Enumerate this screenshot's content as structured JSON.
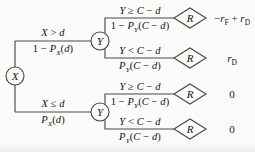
{
  "diagram": {
    "kind": "probability-event-tree",
    "colors": {
      "line": "#4a4a4a",
      "text": "#141414",
      "background": "#fbfbfa"
    },
    "root": {
      "label": "X"
    },
    "branches": [
      {
        "condition": [
          {
            "t": "X",
            "i": true
          },
          {
            "t": " > ",
            "i": false
          },
          {
            "t": "d",
            "i": true
          }
        ],
        "probability": [
          {
            "t": "1 − ",
            "i": false
          },
          {
            "t": "P",
            "i": true
          },
          {
            "t": "X",
            "i": true,
            "s": true
          },
          {
            "t": "(",
            "i": false
          },
          {
            "t": "d",
            "i": true
          },
          {
            "t": ")",
            "i": false
          }
        ],
        "node": {
          "label": "Y"
        },
        "children": [
          {
            "condition": [
              {
                "t": "Y",
                "i": true
              },
              {
                "t": " ≥ ",
                "i": false
              },
              {
                "t": "C",
                "i": true
              },
              {
                "t": " − ",
                "i": false
              },
              {
                "t": "d",
                "i": true
              }
            ],
            "probability": [
              {
                "t": "1 − ",
                "i": false
              },
              {
                "t": "P",
                "i": true
              },
              {
                "t": "Y",
                "i": true,
                "s": true
              },
              {
                "t": "(",
                "i": false
              },
              {
                "t": "C",
                "i": true
              },
              {
                "t": " − ",
                "i": false
              },
              {
                "t": "d",
                "i": true
              },
              {
                "t": ")",
                "i": false
              }
            ],
            "result_node": {
              "label": "R"
            },
            "outcome": [
              {
                "t": "−",
                "i": false
              },
              {
                "t": "r",
                "i": true
              },
              {
                "t": "F",
                "i": false,
                "s": true
              },
              {
                "t": " + ",
                "i": false
              },
              {
                "t": "r",
                "i": true
              },
              {
                "t": "D",
                "i": false,
                "s": true
              }
            ]
          },
          {
            "condition": [
              {
                "t": "Y",
                "i": true
              },
              {
                "t": " < ",
                "i": false
              },
              {
                "t": "C",
                "i": true
              },
              {
                "t": " − ",
                "i": false
              },
              {
                "t": "d",
                "i": true
              }
            ],
            "probability": [
              {
                "t": "P",
                "i": true
              },
              {
                "t": "Y",
                "i": true,
                "s": true
              },
              {
                "t": "(",
                "i": false
              },
              {
                "t": "C",
                "i": true
              },
              {
                "t": " − ",
                "i": false
              },
              {
                "t": "d",
                "i": true
              },
              {
                "t": ")",
                "i": false
              }
            ],
            "result_node": {
              "label": "R"
            },
            "outcome": [
              {
                "t": "r",
                "i": true
              },
              {
                "t": "D",
                "i": false,
                "s": true
              }
            ]
          }
        ]
      },
      {
        "condition": [
          {
            "t": "X",
            "i": true
          },
          {
            "t": " ≤ ",
            "i": false
          },
          {
            "t": "d",
            "i": true
          }
        ],
        "probability": [
          {
            "t": "P",
            "i": true
          },
          {
            "t": "X",
            "i": true,
            "s": true
          },
          {
            "t": "(",
            "i": false
          },
          {
            "t": "d",
            "i": true
          },
          {
            "t": ")",
            "i": false
          }
        ],
        "node": {
          "label": "Y"
        },
        "children": [
          {
            "condition": [
              {
                "t": "Y",
                "i": true
              },
              {
                "t": " ≥ ",
                "i": false
              },
              {
                "t": "C",
                "i": true
              },
              {
                "t": " − ",
                "i": false
              },
              {
                "t": "d",
                "i": true
              }
            ],
            "probability": [
              {
                "t": "1 − ",
                "i": false
              },
              {
                "t": "P",
                "i": true
              },
              {
                "t": "Y",
                "i": true,
                "s": true
              },
              {
                "t": "(",
                "i": false
              },
              {
                "t": "C",
                "i": true
              },
              {
                "t": " − ",
                "i": false
              },
              {
                "t": "d",
                "i": true
              },
              {
                "t": ")",
                "i": false
              }
            ],
            "result_node": {
              "label": "R"
            },
            "outcome": [
              {
                "t": "0",
                "i": false
              }
            ]
          },
          {
            "condition": [
              {
                "t": "Y",
                "i": true
              },
              {
                "t": " < ",
                "i": false
              },
              {
                "t": "C",
                "i": true
              },
              {
                "t": " − ",
                "i": false
              },
              {
                "t": "d",
                "i": true
              }
            ],
            "probability": [
              {
                "t": "P",
                "i": true
              },
              {
                "t": "Y",
                "i": true,
                "s": true
              },
              {
                "t": "(",
                "i": false
              },
              {
                "t": "C",
                "i": true
              },
              {
                "t": " − ",
                "i": false
              },
              {
                "t": "d",
                "i": true
              },
              {
                "t": ")",
                "i": false
              }
            ],
            "result_node": {
              "label": "R"
            },
            "outcome": [
              {
                "t": "0",
                "i": false
              }
            ]
          }
        ]
      }
    ]
  }
}
